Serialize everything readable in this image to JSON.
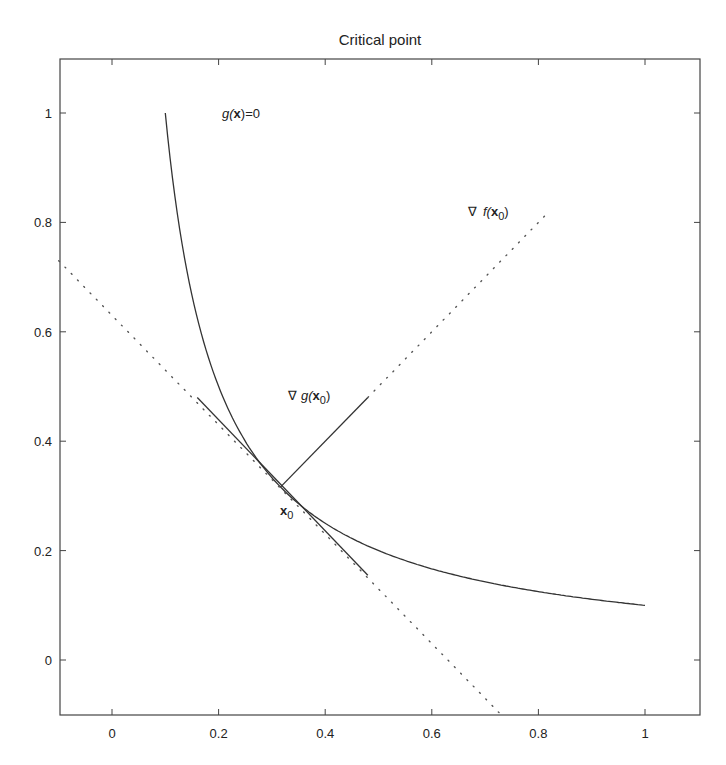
{
  "chart_data": {
    "type": "line",
    "title": "Critical point",
    "xlabel": "",
    "ylabel": "",
    "xlim": [
      -0.1,
      1.1
    ],
    "ylim": [
      -0.1,
      1.1
    ],
    "grid": false,
    "legend": null,
    "x_ticks": [
      0,
      0.2,
      0.4,
      0.6,
      0.8,
      1
    ],
    "x_tick_labels": [
      "0",
      "0.2",
      "0.4",
      "0.6",
      "0.8",
      "1"
    ],
    "y_ticks": [
      0,
      0.2,
      0.4,
      0.6,
      0.8,
      1
    ],
    "y_tick_labels": [
      "0",
      "0.2",
      "0.4",
      "0.6",
      "0.8",
      "1"
    ],
    "series": [
      {
        "name": "g(x)=0 constraint curve",
        "style": "solid",
        "function": "y = 0.1/x",
        "x_range": [
          0.1,
          1.0
        ],
        "points": [
          [
            0.1,
            1.0
          ],
          [
            0.12,
            0.833
          ],
          [
            0.15,
            0.667
          ],
          [
            0.2,
            0.5
          ],
          [
            0.25,
            0.4
          ],
          [
            0.316,
            0.316
          ],
          [
            0.4,
            0.25
          ],
          [
            0.5,
            0.2
          ],
          [
            0.6,
            0.167
          ],
          [
            0.7,
            0.143
          ],
          [
            0.8,
            0.125
          ],
          [
            0.9,
            0.111
          ],
          [
            1.0,
            0.1
          ]
        ]
      },
      {
        "name": "tangent line (solid segment)",
        "style": "solid",
        "points": [
          [
            0.16,
            0.48
          ],
          [
            0.48,
            0.155
          ]
        ]
      },
      {
        "name": "tangent line (dotted extension)",
        "style": "dotted",
        "points": [
          [
            -0.1,
            0.73
          ],
          [
            0.73,
            -0.1
          ]
        ]
      },
      {
        "name": "grad g(x0)",
        "style": "solid",
        "points": [
          [
            0.316,
            0.316
          ],
          [
            0.48,
            0.48
          ]
        ]
      },
      {
        "name": "grad f(x0) direction",
        "style": "dotted",
        "points": [
          [
            0.48,
            0.48
          ],
          [
            0.82,
            0.82
          ]
        ]
      }
    ],
    "annotations": [
      {
        "text": "g(x)=0",
        "x": 0.21,
        "y": 0.99
      },
      {
        "text": "∇ f(x0)",
        "x": 0.67,
        "y": 0.82
      },
      {
        "text": "∇ g(x0)",
        "x": 0.33,
        "y": 0.49
      },
      {
        "text": "x0",
        "x": 0.318,
        "y": 0.265
      }
    ],
    "critical_point": [
      0.316,
      0.316
    ]
  },
  "labels": {
    "title": "Critical point",
    "ann_g": "g(",
    "ann_g_bold": "x",
    "ann_g_end": ")=0",
    "ann_f_nabla": "∇",
    "ann_f": "f(",
    "ann_f_bold": "x",
    "ann_f_sub": "0",
    "ann_f_end": ")",
    "ann_dg_nabla": "∇",
    "ann_dg": "g(",
    "ann_dg_bold": "x",
    "ann_dg_sub": "0",
    "ann_dg_end": ")",
    "ann_x0": "x",
    "ann_x0_sub": "0",
    "xt": [
      "0",
      "0.2",
      "0.4",
      "0.6",
      "0.8",
      "1"
    ],
    "yt": [
      "0",
      "0.2",
      "0.4",
      "0.6",
      "0.8",
      "1"
    ]
  }
}
